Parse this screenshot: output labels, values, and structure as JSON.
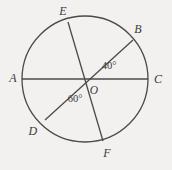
{
  "figure": {
    "kind": "circle-geometry-diagram",
    "background_color": "#f2f1ef",
    "stroke_color": "#4a4a4a",
    "text_color": "#3a3a3a",
    "width": 172,
    "height": 170
  },
  "circle": {
    "center_label": "O",
    "center_x": 85,
    "center_y": 79,
    "radius": 63
  },
  "points": [
    {
      "label": "A",
      "x": 22,
      "y": 79,
      "label_x": 13,
      "label_y": 78
    },
    {
      "label": "B",
      "x": 133,
      "y": 40,
      "label_x": 138,
      "label_y": 29
    },
    {
      "label": "C",
      "x": 148,
      "y": 79,
      "label_x": 158,
      "label_y": 79
    },
    {
      "label": "D",
      "x": 45,
      "y": 120,
      "label_x": 33,
      "label_y": 131
    },
    {
      "label": "E",
      "x": 68,
      "y": 22,
      "label_x": 63,
      "label_y": 11
    },
    {
      "label": "F",
      "x": 103,
      "y": 141,
      "label_x": 107,
      "label_y": 153
    }
  ],
  "chords": [
    {
      "name": "diameter-AC",
      "from": "A",
      "to": "C",
      "x1": 22,
      "y1": 79,
      "x2": 148,
      "y2": 79
    },
    {
      "name": "diameter-BD",
      "from": "B",
      "to": "D",
      "x1": 133,
      "y1": 40,
      "x2": 45,
      "y2": 120
    },
    {
      "name": "diameter-EF",
      "from": "E",
      "to": "F",
      "x1": 68,
      "y1": 22,
      "x2": 103,
      "y2": 141
    }
  ],
  "angles": [
    {
      "name": "angle-BOC",
      "value": "40°",
      "label_x": 109,
      "label_y": 66
    },
    {
      "name": "angle-DOF",
      "value": "60°",
      "label_x": 75,
      "label_y": 99
    }
  ],
  "center_marker": {
    "label": "O",
    "label_x": 94,
    "label_y": 91
  }
}
